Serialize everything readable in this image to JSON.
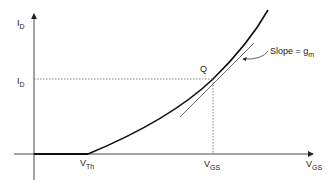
{
  "diagram": {
    "y_axis": {
      "label_main": "I",
      "label_sub": "D"
    },
    "x_axis": {
      "label_main": "V",
      "label_sub": "GS"
    },
    "q_point": {
      "label": "Q"
    },
    "id_marker": {
      "label_main": "I",
      "label_sub": "D"
    },
    "vgs_marker": {
      "label_main": "V",
      "label_sub": "GS"
    },
    "threshold": {
      "label_main": "V",
      "label_sub": "Th"
    },
    "slope_annotation": {
      "label_main": "Slope = g",
      "label_sub": "m"
    },
    "colors": {
      "curve": "#111111",
      "axis": "#333333",
      "dotted": "#555555",
      "tangent": "#444444"
    }
  }
}
